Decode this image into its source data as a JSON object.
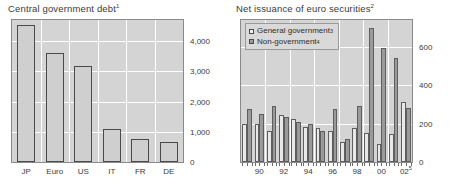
{
  "chart_data": [
    {
      "type": "bar",
      "title": "Central government debt",
      "title_superscript": "1",
      "xlabel": "",
      "ylabel": "",
      "categories": [
        "JP",
        "Euro",
        "US",
        "IT",
        "FR",
        "DE"
      ],
      "values": [
        4550,
        3600,
        3190,
        1080,
        760,
        665
      ],
      "ylim": [
        0,
        4700
      ],
      "yticks": [
        0,
        1000,
        2000,
        3000,
        4000
      ],
      "ytick_labels": [
        "0",
        "1,000",
        "2,000",
        "3,000",
        "4,000"
      ],
      "grid": true,
      "legend": "none",
      "bar_fill": "#cfcfcf",
      "bar_edge": "#4a4a4a",
      "plot_bg": "#d4d4d4"
    },
    {
      "type": "bar",
      "title": "Net issuance of euro securities",
      "title_superscript": "2",
      "xlabel": "",
      "ylabel": "",
      "categories": [
        "89",
        "90",
        "91",
        "92",
        "93",
        "94",
        "95",
        "96",
        "97",
        "98",
        "99",
        "00",
        "01",
        "02"
      ],
      "xticks": [
        "90",
        "92",
        "94",
        "96",
        "98",
        "00",
        "02"
      ],
      "xtick_last_superscript": "5",
      "series": [
        {
          "name": "General government",
          "superscript": "3",
          "color": "#e8e8e8",
          "values": [
            200,
            196,
            160,
            246,
            224,
            182,
            176,
            164,
            104,
            176,
            152,
            96,
            148,
            312
          ]
        },
        {
          "name": "Non-government",
          "superscript": "4",
          "color": "#9a9a9a",
          "values": [
            274,
            252,
            292,
            232,
            210,
            196,
            164,
            276,
            122,
            290,
            700,
            596,
            544,
            284
          ]
        }
      ],
      "ylim": [
        0,
        740
      ],
      "yticks": [
        0,
        200,
        400,
        600
      ],
      "ytick_labels": [
        "0",
        "200",
        "400",
        "600"
      ],
      "grid": true,
      "legend_position": "top-left",
      "plot_bg": "#d4d4d4"
    }
  ],
  "footnote": ""
}
